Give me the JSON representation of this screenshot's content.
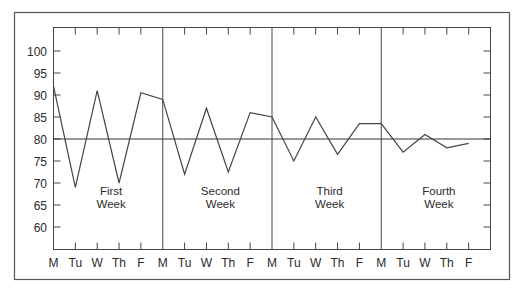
{
  "chart_data": {
    "type": "line",
    "title": "",
    "xlabel": "",
    "ylabel": "",
    "ylim": [
      55,
      105
    ],
    "yticks": [
      60,
      65,
      70,
      75,
      80,
      85,
      90,
      95,
      100
    ],
    "grid": false,
    "legend": null,
    "reference_line": {
      "y": 80
    },
    "x": [
      "M",
      "Tu",
      "W",
      "Th",
      "F",
      "M",
      "Tu",
      "W",
      "Th",
      "F",
      "M",
      "Tu",
      "W",
      "Th",
      "F",
      "M",
      "Tu",
      "W",
      "Th",
      "F"
    ],
    "week_labels": [
      {
        "line1": "First",
        "line2": "Week"
      },
      {
        "line1": "Second",
        "line2": "Week"
      },
      {
        "line1": "Third",
        "line2": "Week"
      },
      {
        "line1": "Fourth",
        "line2": "Week"
      }
    ],
    "series": [
      {
        "name": "values",
        "values": [
          92,
          69,
          91,
          70,
          90.5,
          89,
          72,
          87,
          72.5,
          86,
          85,
          75,
          85,
          76.5,
          83.5,
          83.5,
          77,
          81,
          78,
          79
        ]
      }
    ]
  }
}
